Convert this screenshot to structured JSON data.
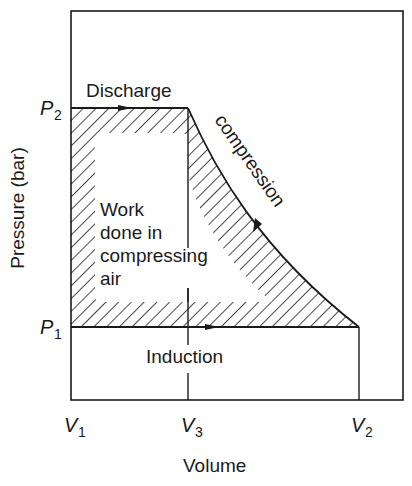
{
  "diagram": {
    "axes": {
      "xlabel": "Volume",
      "ylabel": "Pressure (bar)",
      "x_ticks": [
        {
          "main": "V",
          "sub": "1"
        },
        {
          "main": "V",
          "sub": "3"
        },
        {
          "main": "V",
          "sub": "2"
        }
      ],
      "y_ticks": [
        {
          "main": "P",
          "sub": "2"
        },
        {
          "main": "P",
          "sub": "1"
        }
      ]
    },
    "process_labels": {
      "discharge": "Discharge",
      "compression": "compression",
      "induction": "Induction"
    },
    "area_label": {
      "line1": "Work",
      "line2": "done in",
      "line3": "compressing",
      "line4": "air"
    },
    "colors": {
      "line": "#1a1a1a",
      "background": "#ffffff"
    }
  }
}
